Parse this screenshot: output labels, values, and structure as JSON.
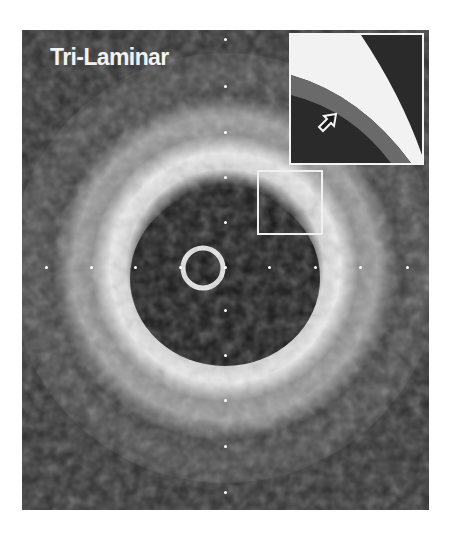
{
  "figure": {
    "label": "Tri-Laminar",
    "modality": "intravascular ultrasound cross-section",
    "inset": {
      "description": "magnified view of boxed region",
      "arrow_icon": "arrow-pointing-up-right"
    },
    "colors": {
      "background": "#2c2c2c",
      "tissue_bright": "#f0f0f0",
      "lumen": "#141414",
      "markers": "#ffffff",
      "outline": "#f4f4f4"
    },
    "calibration_markers": {
      "spacing_px": 45,
      "horizontal_count": 9,
      "vertical_count": 9
    }
  }
}
